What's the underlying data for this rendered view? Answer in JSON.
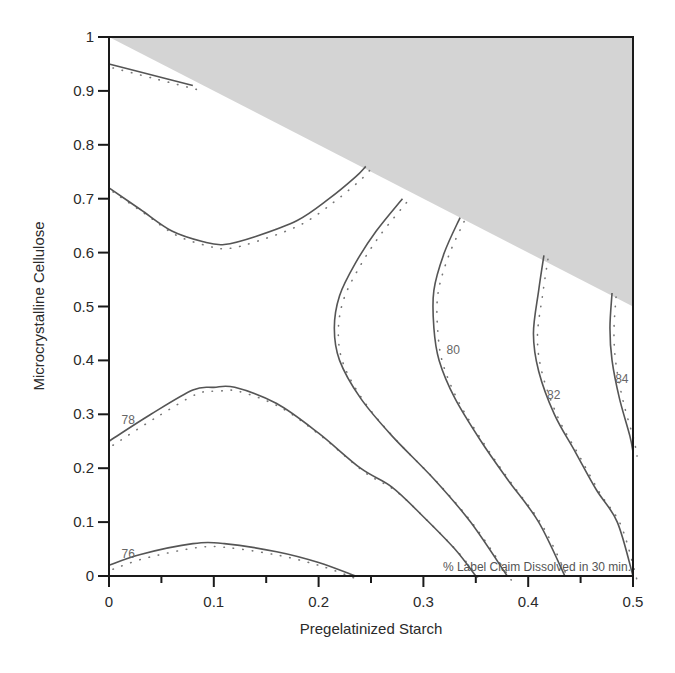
{
  "chart_data": {
    "type": "contour",
    "title": "",
    "annotation": "% Label Claim Dissolved in 30 min.",
    "xlabel": "Pregelatinized Starch",
    "ylabel": "Microcrystalline Cellulose",
    "xlim": [
      0,
      0.5
    ],
    "ylim": [
      0,
      1
    ],
    "x_ticks": [
      "0",
      "0.1",
      "0.2",
      "0.3",
      "0.4",
      "0.5"
    ],
    "y_ticks": [
      "0",
      "0.1",
      "0.2",
      "0.3",
      "0.4",
      "0.5",
      "0.6",
      "0.7",
      "0.8",
      "0.9",
      "1"
    ],
    "grid": false,
    "infeasible_region": {
      "description": "Shaded gray region where constraint is violated (above line from (0,1) to (0.5,0.5))",
      "vertices": [
        [
          0,
          1
        ],
        [
          0.5,
          1
        ],
        [
          0.5,
          0.5
        ]
      ],
      "color": "#d4d4d4"
    },
    "contours": [
      {
        "level": 76,
        "label": "76",
        "points": [
          [
            0,
            0.02
          ],
          [
            0.03,
            0.04
          ],
          [
            0.08,
            0.06
          ],
          [
            0.11,
            0.06
          ],
          [
            0.16,
            0.045
          ],
          [
            0.2,
            0.025
          ],
          [
            0.235,
            0.0
          ]
        ]
      },
      {
        "level": 78,
        "label": "78",
        "points": [
          [
            0,
            0.25
          ],
          [
            0.04,
            0.3
          ],
          [
            0.08,
            0.345
          ],
          [
            0.1,
            0.35
          ],
          [
            0.12,
            0.35
          ],
          [
            0.16,
            0.32
          ],
          [
            0.2,
            0.265
          ],
          [
            0.24,
            0.2
          ],
          [
            0.27,
            0.165
          ],
          [
            0.3,
            0.11
          ],
          [
            0.33,
            0.05
          ],
          [
            0.35,
            0.0
          ]
        ]
      },
      {
        "level": 78,
        "label": "",
        "points": [
          [
            0,
            0.95
          ],
          [
            0.04,
            0.93
          ],
          [
            0.08,
            0.91
          ]
        ]
      },
      {
        "level": 78,
        "label": "",
        "points": [
          [
            0,
            0.72
          ],
          [
            0.03,
            0.68
          ],
          [
            0.06,
            0.64
          ],
          [
            0.09,
            0.62
          ],
          [
            0.11,
            0.615
          ],
          [
            0.14,
            0.63
          ],
          [
            0.18,
            0.66
          ],
          [
            0.21,
            0.7
          ],
          [
            0.235,
            0.74
          ],
          [
            0.245,
            0.76
          ]
        ]
      },
      {
        "level": 79,
        "label": "",
        "points": [
          [
            0.28,
            0.7
          ],
          [
            0.255,
            0.64
          ],
          [
            0.235,
            0.58
          ],
          [
            0.22,
            0.52
          ],
          [
            0.215,
            0.46
          ],
          [
            0.22,
            0.4
          ],
          [
            0.24,
            0.33
          ],
          [
            0.27,
            0.26
          ],
          [
            0.31,
            0.18
          ],
          [
            0.345,
            0.1
          ],
          [
            0.38,
            0.0
          ]
        ]
      },
      {
        "level": 80,
        "label": "80",
        "points": [
          [
            0.335,
            0.665
          ],
          [
            0.32,
            0.6
          ],
          [
            0.31,
            0.53
          ],
          [
            0.31,
            0.46
          ],
          [
            0.315,
            0.4
          ],
          [
            0.33,
            0.33
          ],
          [
            0.355,
            0.25
          ],
          [
            0.38,
            0.18
          ],
          [
            0.41,
            0.1
          ],
          [
            0.435,
            0.0
          ]
        ]
      },
      {
        "level": 82,
        "label": "82",
        "points": [
          [
            0.415,
            0.595
          ],
          [
            0.41,
            0.53
          ],
          [
            0.405,
            0.45
          ],
          [
            0.41,
            0.38
          ],
          [
            0.425,
            0.3
          ],
          [
            0.445,
            0.23
          ],
          [
            0.465,
            0.16
          ],
          [
            0.485,
            0.1
          ],
          [
            0.5,
            0.0
          ]
        ]
      },
      {
        "level": 84,
        "label": "84",
        "points": [
          [
            0.48,
            0.525
          ],
          [
            0.478,
            0.46
          ],
          [
            0.48,
            0.4
          ],
          [
            0.487,
            0.33
          ],
          [
            0.497,
            0.26
          ],
          [
            0.5,
            0.23
          ]
        ]
      }
    ],
    "contour_labels": [
      {
        "text": "76",
        "x": 0.012,
        "y": 0.04
      },
      {
        "text": "78",
        "x": 0.012,
        "y": 0.29
      },
      {
        "text": "80",
        "x": 0.322,
        "y": 0.42
      },
      {
        "text": "82",
        "x": 0.418,
        "y": 0.335
      },
      {
        "text": "84",
        "x": 0.483,
        "y": 0.365
      }
    ]
  },
  "labels": {
    "xlabel": "Pregelatinized Starch",
    "ylabel": "Microcrystalline Cellulose",
    "annotation": "% Label Claim Dissolved in 30 min."
  }
}
